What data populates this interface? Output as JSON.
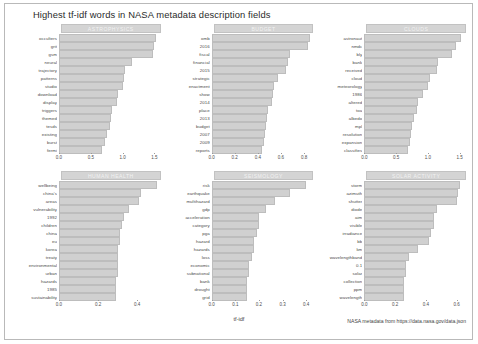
{
  "title": "Highest tf-idf words in NASA metadata description fields",
  "xlabel": "tf-idf",
  "caption": "NASA metadata from https://data.nasa.gov/data.json",
  "colors": {
    "bar_fill": "#d0d0d0",
    "bar_border": "#bdbdbd",
    "strip_fill": "#d4d4d4",
    "strip_text": "#f2f2f2",
    "text": "#3c3c3c",
    "background": "#ffffff"
  },
  "chart_data": {
    "type": "bar",
    "title": "Highest tf-idf words in NASA metadata description fields",
    "subtitle": "",
    "xlabel": "tf-idf",
    "ylabel": "",
    "orientation": "horizontal",
    "grid": false,
    "legend": "none",
    "facet_layout": {
      "rows": 2,
      "cols": 3
    },
    "caption": "NASA metadata from https://data.nasa.gov/data.json",
    "facets": [
      {
        "name": "ASTROPHYSICS",
        "xlim": [
          0.0,
          1.6
        ],
        "xticks": [
          "0.0",
          "0.5",
          "1.0",
          "1.5"
        ],
        "xtick_values": [
          0.0,
          0.5,
          1.0,
          1.5
        ],
        "categories": [
          "occulters",
          "grit",
          "gsm",
          "neural",
          "trajectory",
          "patterns",
          "studio",
          "download",
          "display",
          "triggers",
          "themed",
          "tesds",
          "existing",
          "burst",
          "fermi"
        ],
        "values": [
          1.52,
          1.5,
          1.48,
          1.15,
          1.04,
          1.02,
          1.0,
          0.93,
          0.92,
          0.84,
          0.82,
          0.8,
          0.75,
          0.72,
          0.68
        ]
      },
      {
        "name": "BUDGET",
        "xlim": [
          0.0,
          0.88
        ],
        "xticks": [
          "0.0",
          "0.2",
          "0.4",
          "0.6",
          "0.8"
        ],
        "xtick_values": [
          0.0,
          0.2,
          0.4,
          0.6,
          0.8
        ],
        "categories": [
          "omb",
          "2016",
          "fiscal",
          "financial",
          "2015",
          "strategic",
          "enactment",
          "show",
          "2014",
          "place",
          "2013",
          "budget",
          "2007",
          "2009",
          "reports"
        ],
        "values": [
          0.85,
          0.83,
          0.68,
          0.66,
          0.64,
          0.57,
          0.54,
          0.53,
          0.52,
          0.49,
          0.48,
          0.47,
          0.46,
          0.45,
          0.44
        ]
      },
      {
        "name": "CLOUDS",
        "xlim": [
          0.0,
          1.6
        ],
        "xticks": [
          "0.0",
          "0.5",
          "1.0",
          "1.5"
        ],
        "xtick_values": [
          0.0,
          0.5,
          1.0,
          1.5
        ],
        "categories": [
          "astronaut",
          "nmdc",
          "bly",
          "bank",
          "received",
          "cloud",
          "meteorology",
          "1986",
          "altered",
          "toa",
          "albedo",
          "mpl",
          "resolution",
          "expansion",
          "classifies"
        ],
        "values": [
          1.52,
          1.44,
          1.38,
          1.16,
          1.14,
          1.04,
          1.0,
          0.92,
          0.84,
          0.83,
          0.78,
          0.75,
          0.74,
          0.72,
          0.68
        ]
      },
      {
        "name": "HUMAN HEALTH",
        "xlim": [
          0.0,
          0.52
        ],
        "xticks": [
          "0.0",
          "0.2",
          "0.4"
        ],
        "xtick_values": [
          0.0,
          0.2,
          0.4
        ],
        "categories": [
          "wellbeing",
          "china's",
          "areas",
          "vulnerability",
          "1992",
          "children",
          "china",
          "eu",
          "korea",
          "treaty",
          "environmental",
          "urban",
          "hazards",
          "1985",
          "sustainability"
        ],
        "values": [
          0.5,
          0.42,
          0.41,
          0.36,
          0.33,
          0.32,
          0.31,
          0.31,
          0.3,
          0.3,
          0.3,
          0.3,
          0.29,
          0.29,
          0.29
        ]
      },
      {
        "name": "SEISMOLOGY",
        "xlim": [
          0.0,
          0.43
        ],
        "xticks": [
          "0.0",
          "0.1",
          "0.2",
          "0.3",
          "0.4"
        ],
        "xtick_values": [
          0.0,
          0.1,
          0.2,
          0.3,
          0.4
        ],
        "categories": [
          "risk",
          "earthquake",
          "multihazard",
          "gdp",
          "acceleration",
          "category",
          "pga",
          "hazard",
          "hazards",
          "loss",
          "economic",
          "subnational",
          "bank",
          "drought",
          "grid"
        ],
        "values": [
          0.4,
          0.33,
          0.27,
          0.23,
          0.2,
          0.2,
          0.19,
          0.18,
          0.18,
          0.17,
          0.16,
          0.16,
          0.15,
          0.15,
          0.15
        ]
      },
      {
        "name": "SOLAR ACTIVITY",
        "xlim": [
          0.0,
          0.66
        ],
        "xticks": [
          "0.0",
          "0.2",
          "0.4",
          "0.6"
        ],
        "xtick_values": [
          0.0,
          0.2,
          0.4,
          0.6
        ],
        "categories": [
          "storm",
          "azimuth",
          "shutter",
          "diode",
          "aim",
          "visible",
          "irradiance",
          "bb",
          "km",
          "wavelengthband",
          "0.1",
          "solar",
          "collection",
          "ppm",
          "wavelength"
        ],
        "values": [
          0.62,
          0.61,
          0.6,
          0.47,
          0.45,
          0.45,
          0.43,
          0.42,
          0.35,
          0.29,
          0.27,
          0.27,
          0.26,
          0.26,
          0.26
        ]
      }
    ]
  }
}
